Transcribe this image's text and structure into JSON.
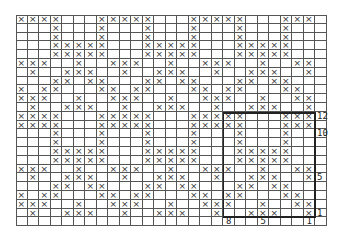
{
  "chart": {
    "symbol": "×",
    "cols": 26,
    "rows": 24,
    "cell_width": 11.5,
    "cell_height": 8.8,
    "grid_rows": [
      "XXXX...XXXXX...XXXXX...XXX",
      "...X...X...X...X...X...X..",
      "...X...X...X...X...X...X..",
      "...XXXXX...XXXXX...XXXXX..",
      "...XXXXX...XXXXX...XXXXX..",
      "XXX..X..XXX..X..XXX..X..XX",
      ".X..XXX..X..XXX..X..XXX..X",
      "...XX.XX...XX.XX...XX.XX..",
      "X.XX...XX.XX...XX.XX...XX.",
      "XXX..X..XXX..X..XXX..X..XX",
      ".X..XXX..X..XXX..X..XXX..X",
      "XXXX...XXXXX...XXXXX...XXX",
      "XXXX...XXXXX...XXXXX...XXX",
      "...X...X...X...X...X...X..",
      "...X...X...X...X...X...X..",
      "...XXXXX...XXXXX...XXXXX..",
      "...XXXXX...XXXXX...XXXXX..",
      "XXX..X..XXX..X..XXX..X..XX",
      ".X..XXX..X..XXX..X..XXX..X",
      "...XX.XX...XX.XX...XX.XX..",
      "X.XX...XX.XX...XX.XX...XX.",
      "XXX..X..XXX..X..XXX..X..XX",
      ".X..XXX..X..XXX..X..XXX..X",
      ".........................."
    ],
    "repeat_box": {
      "col_start": 18,
      "col_end": 25,
      "row_start": 11,
      "row_end": 22
    },
    "row_labels": [
      {
        "text": "12",
        "row": 11
      },
      {
        "text": "10",
        "row": 13
      },
      {
        "text": "5",
        "row": 18
      },
      {
        "text": "1",
        "row": 22
      }
    ],
    "col_labels": [
      {
        "text": "8",
        "col": 18
      },
      {
        "text": "5",
        "col": 21
      },
      {
        "text": "1",
        "col": 25
      }
    ]
  }
}
